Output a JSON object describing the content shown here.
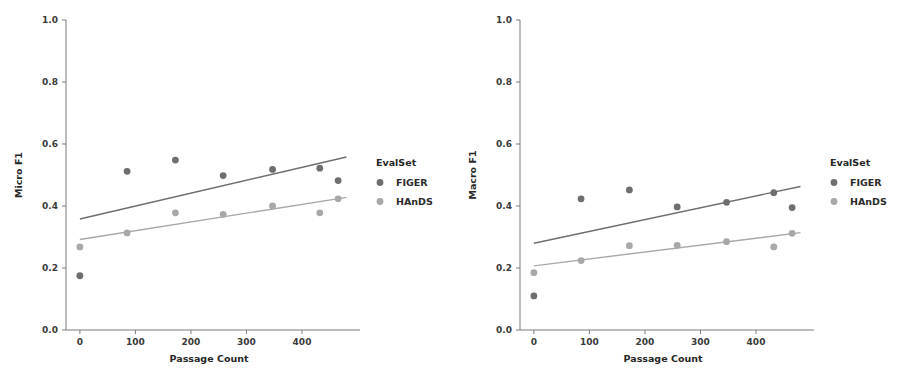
{
  "figure": {
    "background": "#ffffff",
    "panel_count": 2
  },
  "legend": {
    "title": "EvalSet",
    "entries": [
      {
        "label": "FIGER",
        "color": "#6e6e6e"
      },
      {
        "label": "HAnDS",
        "color": "#a8a8a8"
      }
    ],
    "position": "right"
  },
  "colors": {
    "figer": "#6e6e6e",
    "hands": "#a8a8a8",
    "axis": "#7a7a7a",
    "text": "#262626"
  },
  "chart_data": [
    {
      "type": "scatter",
      "title": "",
      "xlabel": "Passage Count",
      "ylabel": "Micro F1",
      "xlim": [
        -25,
        490
      ],
      "ylim": [
        0.0,
        1.0
      ],
      "xticks": [
        0,
        100,
        200,
        300,
        400
      ],
      "xtick_labels": [
        "0",
        "100",
        "200",
        "300",
        "400"
      ],
      "yticks": [
        0.0,
        0.2,
        0.4,
        0.6,
        0.8,
        1.0
      ],
      "ytick_labels": [
        "0.0",
        "0.2",
        "0.4",
        "0.6",
        "0.8",
        "1.0"
      ],
      "grid": false,
      "legend_title": "EvalSet",
      "series": [
        {
          "name": "FIGER",
          "color": "#6e6e6e",
          "x": [
            0,
            85,
            172,
            258,
            347,
            432,
            465
          ],
          "y": [
            0.175,
            0.512,
            0.548,
            0.498,
            0.518,
            0.522,
            0.482
          ],
          "trendline": {
            "x0": 0,
            "y0": 0.358,
            "x1": 480,
            "y1": 0.558
          }
        },
        {
          "name": "HAnDS",
          "color": "#a8a8a8",
          "x": [
            0,
            85,
            172,
            258,
            347,
            432,
            465
          ],
          "y": [
            0.268,
            0.313,
            0.378,
            0.373,
            0.4,
            0.378,
            0.423
          ],
          "trendline": {
            "x0": 0,
            "y0": 0.292,
            "x1": 480,
            "y1": 0.428
          }
        }
      ]
    },
    {
      "type": "scatter",
      "title": "",
      "xlabel": "Passage Count",
      "ylabel": "Macro F1",
      "xlim": [
        -25,
        490
      ],
      "ylim": [
        0.0,
        1.0
      ],
      "xticks": [
        0,
        100,
        200,
        300,
        400
      ],
      "xtick_labels": [
        "0",
        "100",
        "200",
        "300",
        "400"
      ],
      "yticks": [
        0.0,
        0.2,
        0.4,
        0.6,
        0.8,
        1.0
      ],
      "ytick_labels": [
        "0.0",
        "0.2",
        "0.4",
        "0.6",
        "0.8",
        "1.0"
      ],
      "grid": false,
      "legend_title": "EvalSet",
      "series": [
        {
          "name": "FIGER",
          "color": "#6e6e6e",
          "x": [
            0,
            85,
            172,
            258,
            347,
            432,
            465
          ],
          "y": [
            0.11,
            0.423,
            0.452,
            0.397,
            0.412,
            0.443,
            0.395
          ],
          "trendline": {
            "x0": 0,
            "y0": 0.28,
            "x1": 480,
            "y1": 0.463
          }
        },
        {
          "name": "HAnDS",
          "color": "#a8a8a8",
          "x": [
            0,
            85,
            172,
            258,
            347,
            432,
            465
          ],
          "y": [
            0.185,
            0.224,
            0.272,
            0.273,
            0.285,
            0.268,
            0.312
          ],
          "trendline": {
            "x0": 0,
            "y0": 0.207,
            "x1": 480,
            "y1": 0.314
          }
        }
      ]
    }
  ]
}
